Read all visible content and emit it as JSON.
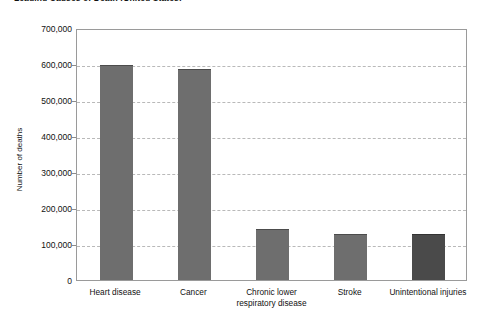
{
  "chart_data": {
    "type": "bar",
    "title": "Leading Causes of Death (United States)",
    "xlabel": "",
    "ylabel": "Number of deaths",
    "categories": [
      "Heart disease",
      "Cancer",
      "Chronic lower respiratory disease",
      "Stroke",
      "Unintentional injuries"
    ],
    "category_lines": [
      [
        "Heart disease"
      ],
      [
        "Cancer"
      ],
      [
        "Chronic lower",
        "respiratory disease"
      ],
      [
        "Stroke"
      ],
      [
        "Unintentional injuries"
      ]
    ],
    "values": [
      597000,
      585000,
      143000,
      128000,
      127000
    ],
    "bar_colors": [
      "#6e6e6e",
      "#6e6e6e",
      "#6e6e6e",
      "#6e6e6e",
      "#4a4a4a"
    ],
    "ylim": [
      0,
      700000
    ],
    "ytick_values": [
      0,
      100000,
      200000,
      300000,
      400000,
      500000,
      600000,
      700000
    ],
    "ytick_labels": [
      "0",
      "100,000",
      "200,000",
      "300,000",
      "400,000",
      "500,000",
      "600,000",
      "700,000"
    ],
    "grid": true,
    "grid_style": "dashed",
    "grid_color": "#b9b9b9",
    "legend": null,
    "legend_position": "none",
    "axis_color": "#9a9a9a",
    "background_color": "#ffffff"
  }
}
